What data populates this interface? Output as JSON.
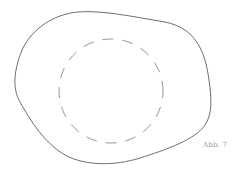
{
  "figure": {
    "caption": "Abb. 7",
    "stroke_color": "#6e6e6e",
    "dash_color": "#8a8a8a",
    "shapes": [
      {
        "name": "outer-blob",
        "style": "solid"
      },
      {
        "name": "inner-circle",
        "style": "dashed"
      }
    ]
  }
}
